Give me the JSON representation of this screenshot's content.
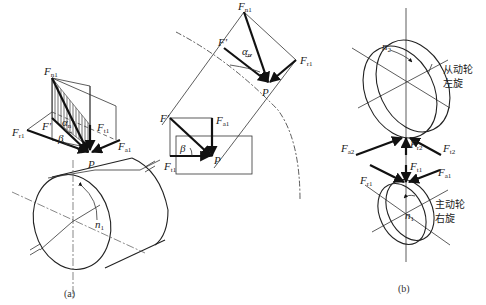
{
  "figure": {
    "panel_a": {
      "caption": "(a)",
      "labels": {
        "Fn1": {
          "main": "F",
          "sub": "n1"
        },
        "Fr1_left": {
          "main": "F",
          "sub": "r1"
        },
        "Fprime": {
          "main": "F'",
          "sub": ""
        },
        "alpha_n": {
          "main": "α",
          "sub": "n"
        },
        "beta": {
          "main": "β",
          "sub": ""
        },
        "Ft1": {
          "main": "F",
          "sub": "t1"
        },
        "Fa1": {
          "main": "F",
          "sub": "a1"
        },
        "P": {
          "main": "P",
          "sub": ""
        },
        "n1": {
          "main": "n",
          "sub": "1"
        }
      }
    },
    "panel_mid": {
      "labels": {
        "Fn1_top": {
          "main": "F",
          "sub": "n1"
        },
        "Fprime_top": {
          "main": "F'",
          "sub": ""
        },
        "alpha_n": {
          "main": "α",
          "sub": "n"
        },
        "Fr1_right": {
          "main": "F",
          "sub": "r1"
        },
        "P_top": {
          "main": "P",
          "sub": ""
        },
        "Fprime_bottom": {
          "main": "F'",
          "sub": ""
        },
        "Fa1_bottom": {
          "main": "F",
          "sub": "a1"
        },
        "beta": {
          "main": "β",
          "sub": ""
        },
        "P_bottom": {
          "main": "P",
          "sub": ""
        },
        "Ft1": {
          "main": "F",
          "sub": "t1"
        }
      }
    },
    "panel_b": {
      "caption": "(b)",
      "driven_gear": {
        "line1": "从动轮",
        "line2": "左旋",
        "speed": {
          "main": "n",
          "sub": "2"
        }
      },
      "driving_gear": {
        "line1": "主动轮",
        "line2": "右旋",
        "speed": {
          "main": "n",
          "sub": "1"
        }
      },
      "labels": {
        "Fa2": {
          "main": "F",
          "sub": "a2"
        },
        "Fr2": {
          "main": "F",
          "sub": "r2"
        },
        "Ft2": {
          "main": "F",
          "sub": "t2"
        },
        "Ft1": {
          "main": "F",
          "sub": "t1"
        },
        "Fa1": {
          "main": "F",
          "sub": "a1"
        },
        "Fr1": {
          "main": "F",
          "sub": "r1"
        }
      }
    }
  }
}
